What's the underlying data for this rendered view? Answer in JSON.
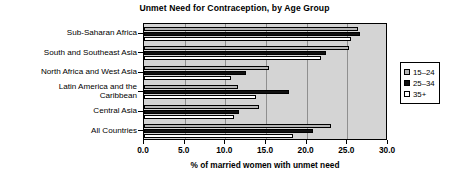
{
  "chart_data": {
    "type": "bar",
    "orientation": "horizontal",
    "title": "Unmet Need for Contraception, by Age Group",
    "xlabel": "% of married women with unmet need",
    "ylabel": "",
    "xlim": [
      0.0,
      30.0
    ],
    "xticks": [
      "0.0",
      "5.0",
      "10.0",
      "15.0",
      "20.0",
      "25.0",
      "30.0"
    ],
    "xtick_values": [
      0.0,
      5.0,
      10.0,
      15.0,
      20.0,
      25.0,
      30.0
    ],
    "grid": true,
    "legend_position": "right",
    "categories": [
      "Sub-Saharan Africa",
      "South and Southeast Asia",
      "North Africa and West Asia",
      "Latin America and the\nCaribbean",
      "Central Asia",
      "All Countries"
    ],
    "series": [
      {
        "name": "15–24",
        "color": "#b6b6b6",
        "values": [
          26.3,
          25.2,
          15.4,
          11.6,
          14.1,
          23.0
        ]
      },
      {
        "name": "25–34",
        "color": "#101010",
        "values": [
          26.6,
          22.4,
          12.5,
          17.8,
          11.7,
          20.8
        ]
      },
      {
        "name": "35+",
        "color": "#ffffff",
        "values": [
          25.5,
          21.8,
          10.7,
          13.8,
          11.1,
          18.3
        ]
      }
    ]
  },
  "legend": {
    "items": [
      {
        "label": "15–24"
      },
      {
        "label": "25–34"
      },
      {
        "label": "35+"
      }
    ]
  }
}
